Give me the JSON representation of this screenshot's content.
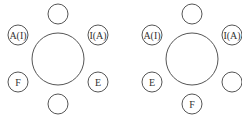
{
  "diagrams": [
    {
      "name": "arrangement-1",
      "table": {
        "cx": 58,
        "cy": 59,
        "r": 26
      },
      "seats": [
        {
          "position": "top",
          "cx": 58,
          "cy": 14,
          "label": ""
        },
        {
          "position": "upper-left",
          "cx": 18,
          "cy": 35,
          "label": "A(I)"
        },
        {
          "position": "upper-right",
          "cx": 98,
          "cy": 35,
          "label": "I(A)"
        },
        {
          "position": "lower-left",
          "cx": 18,
          "cy": 82,
          "label": "F"
        },
        {
          "position": "lower-right",
          "cx": 98,
          "cy": 82,
          "label": "E"
        },
        {
          "position": "bottom",
          "cx": 58,
          "cy": 104,
          "label": ""
        }
      ]
    },
    {
      "name": "arrangement-2",
      "table": {
        "cx": 192,
        "cy": 59,
        "r": 26
      },
      "seats": [
        {
          "position": "top",
          "cx": 192,
          "cy": 14,
          "label": ""
        },
        {
          "position": "upper-left",
          "cx": 152,
          "cy": 35,
          "label": "A(I)"
        },
        {
          "position": "upper-right",
          "cx": 232,
          "cy": 35,
          "label": "I(A)"
        },
        {
          "position": "lower-left",
          "cx": 152,
          "cy": 82,
          "label": "E"
        },
        {
          "position": "lower-right",
          "cx": 232,
          "cy": 82,
          "label": ""
        },
        {
          "position": "bottom",
          "cx": 192,
          "cy": 104,
          "label": "F"
        }
      ]
    }
  ],
  "seat_radius": 10
}
